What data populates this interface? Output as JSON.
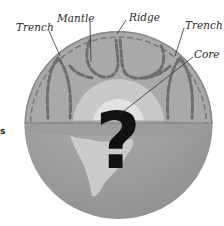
{
  "diagram": {
    "labels": {
      "trench_left": "Trench",
      "mantle": "Mantle",
      "ridge": "Ridge",
      "trench_right": "Trench",
      "core": "Core"
    },
    "core_symbol": "?",
    "edge_fragment": "s",
    "colors": {
      "background": "#ffffff",
      "crust_outline": "#8a8a8a",
      "mantle_fill": "#a9a9a9",
      "convection_cells": "#6e6e6e",
      "outer_core": "#c9c9c9",
      "inner_core": "#e2e2e2",
      "equator_band": "#9a9a9a",
      "lower_hemisphere": "#9e9e9e",
      "continent": "#cfcfcf",
      "label_text": "#2a2a2a",
      "question_mark": "#111111"
    }
  }
}
